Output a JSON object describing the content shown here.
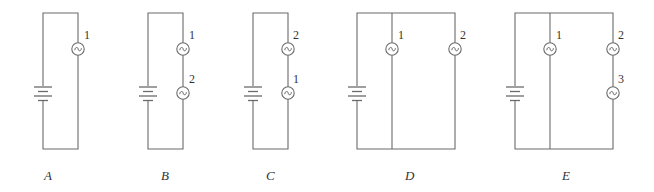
{
  "figure": {
    "colors": {
      "line": "#6b6b6b",
      "text": "#333333",
      "background": "#ffffff"
    },
    "circuits": [
      {
        "id": "A",
        "label": "A",
        "topology": "single bulb in series with battery",
        "bulbs": [
          {
            "number": "1",
            "branch": "right"
          }
        ]
      },
      {
        "id": "B",
        "label": "B",
        "topology": "two bulbs in series",
        "bulbs": [
          {
            "number": "1",
            "branch": "right",
            "position": "upper"
          },
          {
            "number": "2",
            "branch": "right",
            "position": "lower"
          }
        ]
      },
      {
        "id": "C",
        "label": "C",
        "topology": "two bulbs in series",
        "bulbs": [
          {
            "number": "2",
            "branch": "right",
            "position": "upper"
          },
          {
            "number": "1",
            "branch": "right",
            "position": "lower"
          }
        ]
      },
      {
        "id": "D",
        "label": "D",
        "topology": "two bulbs in parallel",
        "bulbs": [
          {
            "number": "1",
            "branch": "middle"
          },
          {
            "number": "2",
            "branch": "right"
          }
        ]
      },
      {
        "id": "E",
        "label": "E",
        "topology": "bulb 1 in parallel with series pair of bulbs 2 and 3",
        "bulbs": [
          {
            "number": "1",
            "branch": "middle"
          },
          {
            "number": "2",
            "branch": "right",
            "position": "upper"
          },
          {
            "number": "3",
            "branch": "right",
            "position": "lower"
          }
        ]
      }
    ]
  }
}
